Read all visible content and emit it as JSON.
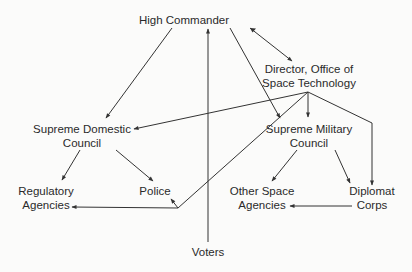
{
  "diagram": {
    "type": "organizational-flow",
    "nodes": [
      {
        "id": "high_commander",
        "lines": [
          "High Commander"
        ]
      },
      {
        "id": "director",
        "lines": [
          "Director, Office of",
          "Space Technology"
        ]
      },
      {
        "id": "supreme_domestic",
        "lines": [
          "Supreme Domestic",
          "Council"
        ]
      },
      {
        "id": "supreme_military",
        "lines": [
          "Supreme Military",
          "Council"
        ]
      },
      {
        "id": "regulatory",
        "lines": [
          "Regulatory",
          "Agencies"
        ]
      },
      {
        "id": "police",
        "lines": [
          "Police"
        ]
      },
      {
        "id": "other_space",
        "lines": [
          "Other Space",
          "Agencies"
        ]
      },
      {
        "id": "diplomat",
        "lines": [
          "Diplomat",
          "Corps"
        ]
      },
      {
        "id": "voters",
        "lines": [
          "Voters"
        ]
      }
    ],
    "edges": [
      {
        "from": "high_commander",
        "to": "supreme_domestic"
      },
      {
        "from": "high_commander",
        "to": "supreme_military"
      },
      {
        "from": "high_commander",
        "to": "director",
        "bidirectional": true
      },
      {
        "from": "voters",
        "to": "high_commander"
      },
      {
        "from": "director",
        "to": "supreme_domestic"
      },
      {
        "from": "director",
        "to": "supreme_military"
      },
      {
        "from": "director",
        "to": "diplomat"
      },
      {
        "from": "director",
        "to": "regulatory",
        "via": "junction"
      },
      {
        "from": "director",
        "to": "police",
        "via": "junction"
      },
      {
        "from": "supreme_domestic",
        "to": "regulatory"
      },
      {
        "from": "supreme_domestic",
        "to": "police"
      },
      {
        "from": "supreme_military",
        "to": "other_space"
      },
      {
        "from": "supreme_military",
        "to": "diplomat"
      },
      {
        "from": "diplomat",
        "to": "other_space"
      }
    ]
  },
  "labels": {
    "high_commander": "High Commander",
    "director_1": "Director, Office of",
    "director_2": "Space Technology",
    "supreme_domestic_1": "Supreme Domestic",
    "supreme_domestic_2": "Council",
    "supreme_military_1": "Supreme Military",
    "supreme_military_2": "Council",
    "regulatory_1": "Regulatory",
    "regulatory_2": "Agencies",
    "police": "Police",
    "other_space_1": "Other Space",
    "other_space_2": "Agencies",
    "diplomat_1": "Diplomat",
    "diplomat_2": "Corps",
    "voters": "Voters"
  },
  "colors": {
    "line": "#333333",
    "background": "#fbfbfa"
  }
}
